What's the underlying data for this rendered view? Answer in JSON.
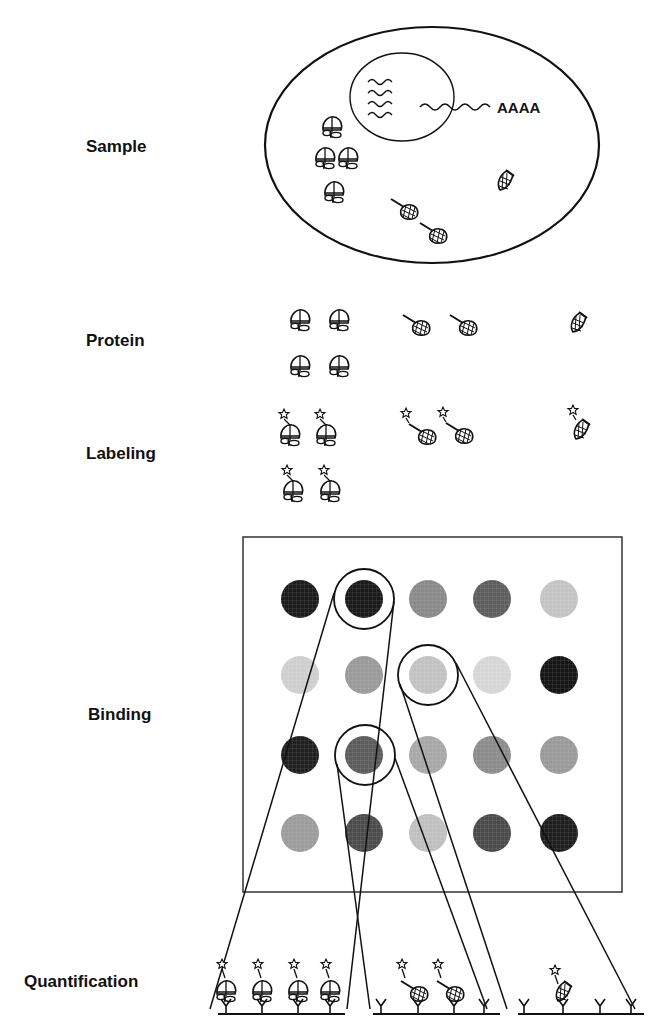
{
  "steps": [
    {
      "id": "sample",
      "label": "Sample",
      "x": 86,
      "y": 152
    },
    {
      "id": "protein",
      "label": "Protein",
      "x": 86,
      "y": 346
    },
    {
      "id": "labeling",
      "label": "Labeling",
      "x": 86,
      "y": 459
    },
    {
      "id": "binding",
      "label": "Binding",
      "x": 88,
      "y": 720
    },
    {
      "id": "quantification",
      "label": "Quantification",
      "x": 24,
      "y": 987
    }
  ],
  "cell": {
    "ellipse": {
      "cx": 432,
      "cy": 145,
      "rx": 167,
      "ry": 118
    },
    "nucleus": {
      "cx": 402,
      "cy": 97,
      "rx": 52,
      "ry": 44
    },
    "mrna_tail_label": "AAAA",
    "mrna_tail_pos": {
      "x": 497,
      "y": 113
    }
  },
  "protein_types": [
    {
      "id": "globular",
      "name": "globular-protein"
    },
    {
      "id": "tailed",
      "name": "tailed-protein"
    },
    {
      "id": "cone",
      "name": "cone-protein"
    }
  ],
  "sample_proteins": [
    {
      "type": "globular",
      "x": 332,
      "y": 128
    },
    {
      "type": "globular",
      "x": 325,
      "y": 159
    },
    {
      "type": "globular",
      "x": 348,
      "y": 159
    },
    {
      "type": "globular",
      "x": 334,
      "y": 193
    },
    {
      "type": "tailed",
      "x": 408,
      "y": 210
    },
    {
      "type": "tailed",
      "x": 437,
      "y": 234
    },
    {
      "type": "cone",
      "x": 505,
      "y": 181
    }
  ],
  "isolated_proteins": [
    {
      "type": "globular",
      "x": 300,
      "y": 321
    },
    {
      "type": "globular",
      "x": 339,
      "y": 321
    },
    {
      "type": "globular",
      "x": 300,
      "y": 367
    },
    {
      "type": "globular",
      "x": 339,
      "y": 367
    },
    {
      "type": "tailed",
      "x": 420,
      "y": 326
    },
    {
      "type": "tailed",
      "x": 467,
      "y": 326
    },
    {
      "type": "cone",
      "x": 578,
      "y": 323
    }
  ],
  "labeled_proteins": [
    {
      "type": "globular",
      "x": 290,
      "y": 436
    },
    {
      "type": "globular",
      "x": 326,
      "y": 436
    },
    {
      "type": "globular",
      "x": 293,
      "y": 492
    },
    {
      "type": "globular",
      "x": 330,
      "y": 492
    },
    {
      "type": "tailed",
      "x": 426,
      "y": 435
    },
    {
      "type": "tailed",
      "x": 463,
      "y": 434
    },
    {
      "type": "cone",
      "x": 581,
      "y": 430
    }
  ],
  "array": {
    "frame": {
      "x": 243,
      "y": 537,
      "w": 379,
      "h": 355
    },
    "rows": 4,
    "cols": 5,
    "spot_radius": 19,
    "col_x": [
      300,
      364,
      428,
      492,
      559
    ],
    "row_y": [
      599,
      675,
      755,
      833
    ],
    "spot_colors": [
      [
        "#1c1c1c",
        "#1a1a1a",
        "#8a8a8a",
        "#5e5e5e",
        "#c4c4c4"
      ],
      [
        "#cfcfcf",
        "#9a9a9a",
        "#c2c2c2",
        "#d6d6d6",
        "#161616"
      ],
      [
        "#202020",
        "#5c5c5c",
        "#a8a8a8",
        "#8c8c8c",
        "#9a9a9a"
      ],
      [
        "#9c9c9c",
        "#4c4c4c",
        "#c0c0c0",
        "#4a4a4a",
        "#1e1e1e"
      ]
    ],
    "highlight_circles": [
      {
        "cx": 364,
        "cy": 599,
        "r": 30
      },
      {
        "cx": 428,
        "cy": 675,
        "r": 30
      },
      {
        "cx": 365,
        "cy": 755,
        "r": 30
      }
    ]
  },
  "connector_lines": [
    {
      "x1": 334,
      "y1": 593,
      "x2": 210,
      "y2": 1009
    },
    {
      "x1": 394,
      "y1": 601,
      "x2": 347,
      "y2": 1009
    },
    {
      "x1": 337,
      "y1": 764,
      "x2": 370,
      "y2": 1009
    },
    {
      "x1": 395,
      "y1": 758,
      "x2": 487,
      "y2": 1009
    },
    {
      "x1": 400,
      "y1": 684,
      "x2": 507,
      "y2": 1009
    },
    {
      "x1": 456,
      "y1": 663,
      "x2": 635,
      "y2": 1009
    }
  ],
  "quantification_panels": [
    {
      "id": "panel-globular",
      "x1": 218,
      "x2": 345,
      "baseline_y": 1014,
      "captures": [
        {
          "x": 226,
          "type": "globular"
        },
        {
          "x": 262,
          "type": "globular"
        },
        {
          "x": 298,
          "type": "globular"
        },
        {
          "x": 330,
          "type": "globular"
        }
      ],
      "empty": []
    },
    {
      "id": "panel-tailed",
      "x1": 373,
      "x2": 500,
      "baseline_y": 1014,
      "captures": [
        {
          "x": 418,
          "type": "tailed"
        },
        {
          "x": 454,
          "type": "tailed"
        }
      ],
      "empty": [
        {
          "x": 381
        },
        {
          "x": 484
        }
      ]
    },
    {
      "id": "panel-cone",
      "x1": 518,
      "x2": 644,
      "baseline_y": 1014,
      "captures": [
        {
          "x": 563,
          "type": "cone"
        }
      ],
      "empty": [
        {
          "x": 524
        },
        {
          "x": 600
        },
        {
          "x": 631
        }
      ]
    }
  ]
}
